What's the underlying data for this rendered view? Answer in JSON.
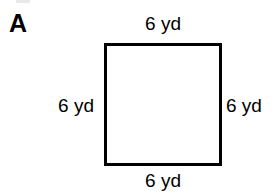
{
  "figure": {
    "label": "A",
    "shape": "square",
    "stroke_color": "#000000",
    "fill_color": "#ffffff",
    "background_color": "#ffffff",
    "unit": "yd",
    "sides": {
      "top": "6 yd",
      "right": "6 yd",
      "bottom": "6 yd",
      "left": "6 yd"
    }
  }
}
